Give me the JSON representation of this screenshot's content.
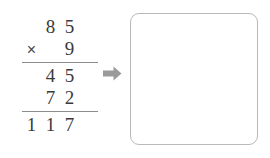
{
  "problem": {
    "label": "long-multiplication",
    "operator": "×",
    "multiplicand": [
      "",
      "8",
      "5"
    ],
    "multiplier": [
      "",
      "",
      "9"
    ],
    "partial_products": [
      {
        "name": "ones-partial",
        "digits": [
          "",
          "4",
          "5"
        ]
      },
      {
        "name": "tens-partial",
        "digits": [
          "",
          "7",
          "2"
        ]
      }
    ],
    "total": [
      "1",
      "1",
      "7"
    ]
  },
  "arrow": {
    "icon": "right-arrow-icon",
    "color": "#9a9a9a"
  },
  "answer_box": {
    "name": "empty-answer-box",
    "value": "",
    "placeholder": "",
    "border_color": "#b9b9b9",
    "background_color": "#ffffff"
  },
  "colors": {
    "digit": "#3a3a3a",
    "rule": "#8c8c8c",
    "background": "#ffffff"
  }
}
